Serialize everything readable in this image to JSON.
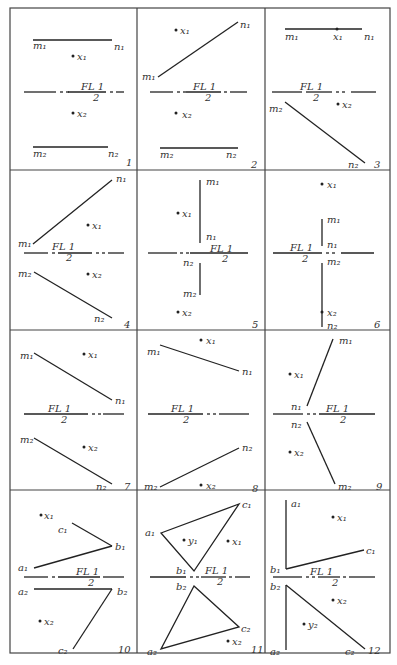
{
  "figure": {
    "grid": {
      "cols": 3,
      "rows": 4,
      "x": [
        10,
        137,
        265,
        390
      ],
      "y": [
        8,
        170,
        330,
        490,
        653
      ]
    },
    "fold_line_label_top": "FL 1",
    "fold_line_label_bottom": "2",
    "ink_color": "#222222",
    "panels": [
      {
        "number": "1",
        "labels": [
          "m1",
          "n1",
          "x1",
          "x2",
          "m2",
          "n2"
        ]
      },
      {
        "number": "2",
        "labels": [
          "x1",
          "n1",
          "m1",
          "x2",
          "m2",
          "n2"
        ]
      },
      {
        "number": "3",
        "labels": [
          "m1",
          "x1",
          "n1",
          "m2",
          "x2",
          "n2"
        ]
      },
      {
        "number": "4",
        "labels": [
          "n1",
          "x1",
          "m1",
          "m2",
          "x2",
          "n2"
        ]
      },
      {
        "number": "5",
        "labels": [
          "m1",
          "x1",
          "n1",
          "n2",
          "m2",
          "x2"
        ]
      },
      {
        "number": "6",
        "labels": [
          "x1",
          "m1",
          "n1",
          "m2",
          "x2",
          "n2"
        ]
      },
      {
        "number": "7",
        "labels": [
          "m1",
          "x1",
          "n1",
          "m2",
          "x2",
          "n2"
        ]
      },
      {
        "number": "8",
        "labels": [
          "x1",
          "m1",
          "n1",
          "n2",
          "m2",
          "x2"
        ]
      },
      {
        "number": "9",
        "labels": [
          "m1",
          "x1",
          "n1",
          "n2",
          "x2",
          "m2"
        ]
      },
      {
        "number": "10",
        "labels": [
          "x1",
          "c1",
          "b1",
          "a1",
          "a2",
          "b2",
          "x2",
          "c2"
        ]
      },
      {
        "number": "11",
        "labels": [
          "c1",
          "a1",
          "y1",
          "x1",
          "b1",
          "b2",
          "c2",
          "x2",
          "a2"
        ]
      },
      {
        "number": "12",
        "labels": [
          "a1",
          "x1",
          "c1",
          "b1",
          "b2",
          "x2",
          "y2",
          "a2",
          "c2"
        ]
      }
    ]
  }
}
